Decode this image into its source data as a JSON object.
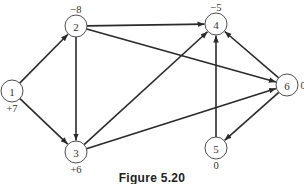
{
  "figure": {
    "caption": "Figure 5.20",
    "nodes": [
      {
        "id": "1",
        "label": "1",
        "supply": "+7",
        "x": 12,
        "y": 91,
        "supply_dx": 0,
        "supply_dy": 17
      },
      {
        "id": "2",
        "label": "2",
        "supply": "−8",
        "x": 76,
        "y": 26,
        "supply_dx": 0,
        "supply_dy": -17
      },
      {
        "id": "3",
        "label": "3",
        "supply": "+6",
        "x": 76,
        "y": 152,
        "supply_dx": 0,
        "supply_dy": 17
      },
      {
        "id": "4",
        "label": "4",
        "supply": "−5",
        "x": 216,
        "y": 24,
        "supply_dx": 0,
        "supply_dy": -17
      },
      {
        "id": "5",
        "label": "5",
        "supply": "0",
        "x": 216,
        "y": 148,
        "supply_dx": 0,
        "supply_dy": 17
      },
      {
        "id": "6",
        "label": "6",
        "supply": "0",
        "x": 287,
        "y": 85,
        "supply_dx": 16,
        "supply_dy": 0
      }
    ],
    "edges": [
      {
        "from": "1",
        "to": "2"
      },
      {
        "from": "1",
        "to": "3"
      },
      {
        "from": "2",
        "to": "3"
      },
      {
        "from": "2",
        "to": "4"
      },
      {
        "from": "2",
        "to": "6"
      },
      {
        "from": "3",
        "to": "4"
      },
      {
        "from": "3",
        "to": "6"
      },
      {
        "from": "5",
        "to": "4"
      },
      {
        "from": "6",
        "to": "4"
      },
      {
        "from": "6",
        "to": "5"
      }
    ],
    "node_radius": 11,
    "colors": {
      "stroke": "#2a2a2a",
      "text": "#333333",
      "background": "#ffffff"
    }
  }
}
